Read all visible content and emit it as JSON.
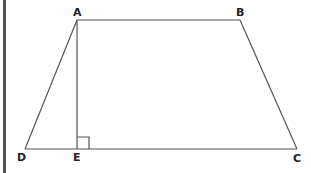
{
  "figure": {
    "type": "trapezoid-with-altitude",
    "vertices": [
      "A",
      "B",
      "C",
      "D",
      "E"
    ],
    "labels": {
      "A": "A",
      "B": "B",
      "C": "C",
      "D": "D",
      "E": "E"
    },
    "segments": [
      "AB",
      "BC",
      "CD",
      "DA",
      "AE"
    ],
    "right_angle_at": "E",
    "line_color": "#555555",
    "label_color": "#222222"
  }
}
